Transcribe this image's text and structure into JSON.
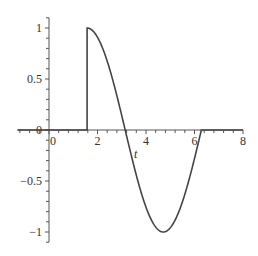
{
  "chart_data": {
    "type": "line",
    "title": "",
    "xlabel": "t",
    "ylabel": "",
    "xlim": [
      -1.3,
      8
    ],
    "ylim": [
      -1.1,
      1.1
    ],
    "grid": false,
    "legend": null,
    "x_ticks": [
      0,
      2,
      4,
      6,
      8
    ],
    "x_tick_labels": [
      "0",
      "2",
      "4",
      "6",
      "8"
    ],
    "y_ticks": [
      -1,
      -0.5,
      0,
      0.5,
      1
    ],
    "y_tick_labels": [
      "-1",
      "-0.5",
      "0",
      "0.5",
      "1"
    ],
    "series": [
      {
        "name": "f(t)",
        "description": "0 for t < pi/2; sin(t) for pi/2 <= t <= 2*pi; 0 for t > 2*pi",
        "color": "#444444",
        "x": [
          -1.3,
          1.5708,
          1.5708,
          2.0,
          2.5,
          3.1416,
          3.5,
          4.0,
          4.7124,
          5.5,
          6.0,
          6.2832,
          8
        ],
        "y": [
          0,
          0,
          1,
          0.909,
          0.598,
          0,
          -0.351,
          -0.757,
          -1,
          -0.706,
          -0.279,
          0,
          0
        ]
      }
    ]
  }
}
